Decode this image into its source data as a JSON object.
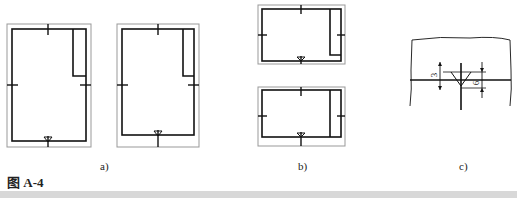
{
  "figure": {
    "caption": "图 A-4",
    "subfigures": [
      {
        "id": "a",
        "label": "a)",
        "description": "Two portrait drawing sheets with frame, centering marks, title block at top-right; left sheet has orientation mark at bottom on frame, right sheet has orientation mark inside frame"
      },
      {
        "id": "b",
        "label": "b)",
        "description": "Two landscape drawing sheets with frame, centering marks and title block on right side"
      },
      {
        "id": "c",
        "label": "c)",
        "description": "Detail of orientation (direction) symbol on sheet edge with dimensions"
      }
    ],
    "dimensions": {
      "dim1": "3",
      "dim2": "6"
    }
  },
  "colors": {
    "line": "#111111",
    "outer_border": "#999999",
    "bar": "#d8d8d8"
  }
}
